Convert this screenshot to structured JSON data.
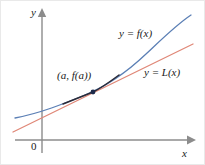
{
  "figure": {
    "width": 205,
    "height": 165,
    "background": "#ffffff",
    "border_color": "#e9e9e9"
  },
  "axes": {
    "x_label": "x",
    "y_label": "y",
    "origin_label": "0",
    "color": "#8c8c8c",
    "x_axis": {
      "x1": 14,
      "y1": 139,
      "x2": 190,
      "y2": 139
    },
    "y_axis": {
      "x1": 41,
      "y1": 152,
      "x2": 41,
      "y2": 12
    }
  },
  "curves": [
    {
      "name": "function-curve",
      "label": "y = f(x)",
      "color": "#5b7fb5",
      "path": "M 14 117 C 40 112 62 103 84 94 C 106 85 126 71 145 53 C 160 39 175 24 190 14"
    },
    {
      "name": "tangent-line",
      "label": "y = L(x)",
      "color": "#e08878",
      "path": "M 12 131 L 192 43"
    }
  ],
  "tangent_point": {
    "label": "(a, f(a))",
    "x": 92,
    "y": 91,
    "color": "#1d2b4a",
    "radius": 2.4
  },
  "overlap_segment": {
    "name": "coincident-segment",
    "color": "#2b2b38",
    "path": "M 62 103 C 72 99 82 95 92 91 C 102 86 110 80 118 74"
  },
  "colors": {
    "function": "#5b7fb5",
    "tangent": "#e08878",
    "axis": "#8c8c8c",
    "text": "#1a1a1a",
    "point": "#1d2b4a"
  }
}
